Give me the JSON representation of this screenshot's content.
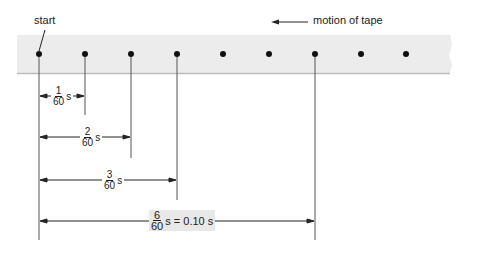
{
  "labels": {
    "start": "start",
    "motion": "motion of tape"
  },
  "tape": {
    "color": "#ececec",
    "dot_color": "#111111",
    "dot_count": 9
  },
  "intervals": [
    {
      "num": "1",
      "den": "60",
      "suffix": "s"
    },
    {
      "num": "2",
      "den": "60",
      "suffix": "s"
    },
    {
      "num": "3",
      "den": "60",
      "suffix": "s"
    },
    {
      "num": "6",
      "den": "60",
      "suffix": "s = 0.10 s"
    }
  ]
}
